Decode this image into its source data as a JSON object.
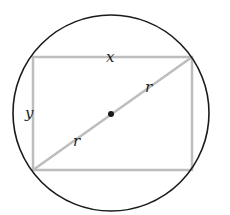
{
  "diagram": {
    "type": "rectangle-inscribed-in-circle",
    "labels": {
      "width": "x",
      "height": "y",
      "radius_upper": "r",
      "radius_lower": "r"
    },
    "colors": {
      "circle_stroke": "#1a1a1a",
      "rectangle_stroke": "#bdbdbd",
      "diagonal_stroke": "#bdbdbd",
      "center_dot": "#1a1a1a",
      "background": "#ffffff"
    },
    "geometry": {
      "circle": {
        "cx": 111,
        "cy": 113,
        "r": 98
      },
      "rectangle": {
        "x1": 33,
        "y1": 57,
        "x2": 192,
        "y2": 170
      },
      "center": {
        "x": 111,
        "y": 113
      }
    }
  }
}
